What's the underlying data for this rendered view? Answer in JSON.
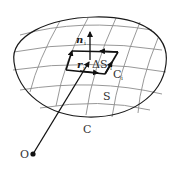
{
  "diagram": {
    "type": "surface-integral-stokes",
    "labels": {
      "normal": "n",
      "normal_sub": "i",
      "position": "r",
      "position_sub": "i",
      "area_element": "ΔS",
      "area_element_sub": "i",
      "patch_boundary": "C",
      "patch_boundary_sub": "i",
      "surface": "S",
      "boundary": "C",
      "origin": "O"
    },
    "colors": {
      "outline": "#1a1a1a",
      "grid": "#8c8c8c",
      "patch": "#111111",
      "text": "#333333"
    }
  }
}
